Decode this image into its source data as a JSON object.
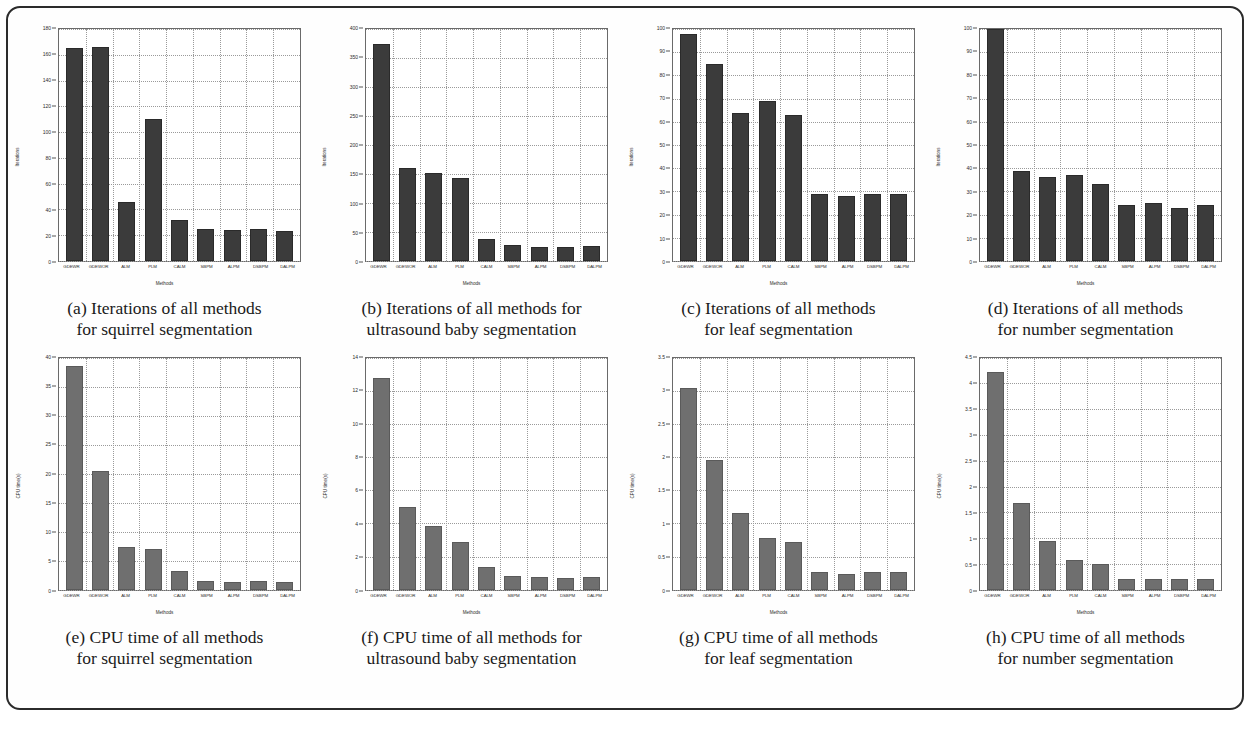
{
  "figure": {
    "border_color": "#2b2b2b",
    "bar_color_iterations": "#3b3b3b",
    "bar_color_cpu": "#6f6f6f",
    "bottom_text": ""
  },
  "methods": [
    "GDEWR",
    "GDEWOR",
    "ALM",
    "PLM",
    "CALM",
    "SBPM",
    "ALPM",
    "DSBPM",
    "DALPM"
  ],
  "panels": [
    {
      "id": "a",
      "caption_line1": "(a) Iterations of all methods",
      "caption_line2": "for squirrel segmentation",
      "chart_data": {
        "type": "bar",
        "title": "",
        "xlabel": "Methods",
        "ylabel": "Iterations",
        "categories": [
          "GDEWR",
          "GDEWOR",
          "ALM",
          "PLM",
          "CALM",
          "SBPM",
          "ALPM",
          "DSBPM",
          "DALPM"
        ],
        "values": [
          165,
          166,
          46,
          110,
          32,
          25,
          24,
          25,
          23
        ],
        "ylim": [
          0,
          180
        ],
        "yticks": [
          0,
          20,
          40,
          60,
          80,
          100,
          120,
          140,
          160,
          180
        ],
        "grid": true,
        "legend": "none"
      }
    },
    {
      "id": "b",
      "caption_line1": "(b) Iterations of all methods for",
      "caption_line2": "ultrasound baby segmentation",
      "chart_data": {
        "type": "bar",
        "title": "",
        "xlabel": "Methods",
        "ylabel": "Iterations",
        "categories": [
          "GDEWR",
          "GDEWOR",
          "ALM",
          "PLM",
          "CALM",
          "SBPM",
          "ALPM",
          "DSBPM",
          "DALPM"
        ],
        "values": [
          375,
          160,
          152,
          143,
          38,
          28,
          25,
          25,
          26
        ],
        "ylim": [
          0,
          400
        ],
        "yticks": [
          0,
          50,
          100,
          150,
          200,
          250,
          300,
          350,
          400
        ],
        "grid": true,
        "legend": "none"
      }
    },
    {
      "id": "c",
      "caption_line1": "(c) Iterations of all methods",
      "caption_line2": "for leaf segmentation",
      "chart_data": {
        "type": "bar",
        "title": "",
        "xlabel": "Methods",
        "ylabel": "Iterations",
        "categories": [
          "GDEWR",
          "GDEWOR",
          "ALM",
          "PLM",
          "CALM",
          "SBPM",
          "ALPM",
          "DSBPM",
          "DALPM"
        ],
        "values": [
          98,
          85,
          64,
          69,
          63,
          29,
          28,
          29,
          29
        ],
        "ylim": [
          0,
          100
        ],
        "yticks": [
          0,
          10,
          20,
          30,
          40,
          50,
          60,
          70,
          80,
          90,
          100
        ],
        "grid": true,
        "legend": "none"
      }
    },
    {
      "id": "d",
      "caption_line1": "(d) Iterations of all methods",
      "caption_line2": "for number segmentation",
      "chart_data": {
        "type": "bar",
        "title": "",
        "xlabel": "Methods",
        "ylabel": "Iterations",
        "categories": [
          "GDEWR",
          "GDEWOR",
          "ALM",
          "PLM",
          "CALM",
          "SBPM",
          "ALPM",
          "DSBPM",
          "DALPM"
        ],
        "values": [
          100,
          39,
          36,
          37,
          33,
          24,
          25,
          23,
          24
        ],
        "ylim": [
          0,
          100
        ],
        "yticks": [
          0,
          10,
          20,
          30,
          40,
          50,
          60,
          70,
          80,
          90,
          100
        ],
        "grid": true,
        "legend": "none"
      }
    },
    {
      "id": "e",
      "caption_line1": "(e) CPU time of all methods",
      "caption_line2": "for squirrel segmentation",
      "chart_data": {
        "type": "bar",
        "title": "",
        "xlabel": "Methods",
        "ylabel": "CPU time(s)",
        "categories": [
          "GDEWR",
          "GDEWOR",
          "ALM",
          "PLM",
          "CALM",
          "SBPM",
          "ALPM",
          "DSBPM",
          "DALPM"
        ],
        "values": [
          38.5,
          20.5,
          7.3,
          7.0,
          3.2,
          1.5,
          1.4,
          1.5,
          1.4
        ],
        "ylim": [
          0,
          40
        ],
        "yticks": [
          0,
          5,
          10,
          15,
          20,
          25,
          30,
          35,
          40
        ],
        "grid": true,
        "legend": "none"
      }
    },
    {
      "id": "f",
      "caption_line1": "(f) CPU time of all methods for",
      "caption_line2": "ultrasound baby segmentation",
      "chart_data": {
        "type": "bar",
        "title": "",
        "xlabel": "Methods",
        "ylabel": "CPU time(s)",
        "categories": [
          "GDEWR",
          "GDEWOR",
          "ALM",
          "PLM",
          "CALM",
          "SBPM",
          "ALPM",
          "DSBPM",
          "DALPM"
        ],
        "values": [
          12.8,
          5.0,
          3.85,
          2.85,
          1.4,
          0.8,
          0.75,
          0.72,
          0.75
        ],
        "ylim": [
          0,
          14
        ],
        "yticks": [
          0,
          2,
          4,
          6,
          8,
          10,
          12,
          14
        ],
        "grid": true,
        "legend": "none"
      }
    },
    {
      "id": "g",
      "caption_line1": "(g) CPU time of all methods",
      "caption_line2": "for leaf segmentation",
      "chart_data": {
        "type": "bar",
        "title": "",
        "xlabel": "Methods",
        "ylabel": "CPU time(s)",
        "categories": [
          "GDEWR",
          "GDEWOR",
          "ALM",
          "PLM",
          "CALM",
          "SBPM",
          "ALPM",
          "DSBPM",
          "DALPM"
        ],
        "values": [
          3.05,
          1.95,
          1.15,
          0.78,
          0.72,
          0.26,
          0.24,
          0.26,
          0.27
        ],
        "ylim": [
          0,
          3.5
        ],
        "yticks": [
          0,
          0.5,
          1,
          1.5,
          2,
          2.5,
          3,
          3.5
        ],
        "grid": true,
        "legend": "none"
      }
    },
    {
      "id": "h",
      "caption_line1": "(h) CPU time of all methods",
      "caption_line2": "for number segmentation",
      "chart_data": {
        "type": "bar",
        "title": "",
        "xlabel": "Methods",
        "ylabel": "CPU time(s)",
        "categories": [
          "GDEWR",
          "GDEWOR",
          "ALM",
          "PLM",
          "CALM",
          "SBPM",
          "ALPM",
          "DSBPM",
          "DALPM"
        ],
        "values": [
          4.22,
          1.68,
          0.95,
          0.58,
          0.5,
          0.2,
          0.21,
          0.2,
          0.21
        ],
        "ylim": [
          0,
          4.5
        ],
        "yticks": [
          0,
          0.5,
          1,
          1.5,
          2,
          2.5,
          3,
          3.5,
          4,
          4.5
        ],
        "grid": true,
        "legend": "none"
      }
    }
  ]
}
